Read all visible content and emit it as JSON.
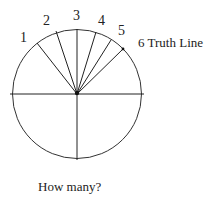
{
  "diagram": {
    "labels": {
      "l1": "1",
      "l2": "2",
      "l3": "3",
      "l4": "4",
      "l5": "5",
      "truth_line": "6 Truth Line"
    },
    "caption": "How many?",
    "circle": {
      "cx": 77,
      "cy": 94,
      "r": 65
    },
    "rays": [
      {
        "id": 1,
        "x": 37,
        "y": 43
      },
      {
        "id": 2,
        "x": 56,
        "y": 32
      },
      {
        "id": 3,
        "x": 77,
        "y": 29
      },
      {
        "id": 4,
        "x": 96,
        "y": 32
      },
      {
        "id": 5,
        "x": 111,
        "y": 40
      },
      {
        "id": 6,
        "x": 123,
        "y": 49
      }
    ],
    "colors": {
      "line": "#222222",
      "background": "#ffffff"
    }
  }
}
